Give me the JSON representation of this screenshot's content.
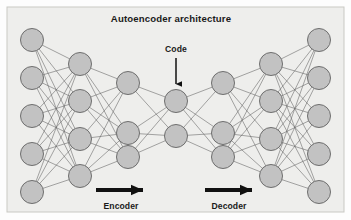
{
  "figure": {
    "title": "Autoencoder architecture",
    "panel": {
      "background_color": "#eeeeec",
      "border_color": "#c9c9c4",
      "x": 7,
      "y": 7,
      "width": 337,
      "height": 205
    },
    "node_style": {
      "fill_color": "#c2c2c2",
      "stroke_color": "#6e6e6e",
      "radius": 11.5
    },
    "edge_style": {
      "stroke_color": "#5f5f5f",
      "stroke_width": 0.55
    },
    "annotations": {
      "code_label": "Code",
      "encoder_label": "Encoder",
      "decoder_label": "Decoder",
      "arrow_color": "#111111"
    },
    "layers": [
      {
        "name": "input-layer",
        "node_count": 5,
        "cx": 32,
        "cys": [
          40,
          78,
          116,
          154,
          192
        ]
      },
      {
        "name": "encoder-hidden-1",
        "node_count": 4,
        "cx": 80,
        "cys": [
          64,
          101,
          139,
          176
        ]
      },
      {
        "name": "encoder-hidden-2",
        "node_count": 3,
        "cx": 128,
        "cys": [
          83,
          133,
          157
        ]
      },
      {
        "name": "code-layer",
        "node_count": 2,
        "cx": 176,
        "cys": [
          101,
          136
        ]
      },
      {
        "name": "decoder-hidden-1",
        "node_count": 3,
        "cx": 223,
        "cys": [
          83,
          133,
          157
        ]
      },
      {
        "name": "decoder-hidden-2",
        "node_count": 4,
        "cx": 271,
        "cys": [
          64,
          101,
          139,
          176
        ]
      },
      {
        "name": "output-layer",
        "node_count": 5,
        "cx": 319,
        "cys": [
          40,
          78,
          116,
          154,
          192
        ]
      }
    ],
    "code_arrow": {
      "x": 176,
      "y_start": 58,
      "y_end": 84
    },
    "encoder_arrow": {
      "x_start": 96,
      "x_end": 143,
      "y": 190
    },
    "decoder_arrow": {
      "x_start": 205,
      "x_end": 252,
      "y": 190
    },
    "title_pos": {
      "x": 171,
      "y": 22
    },
    "code_label_pos": {
      "x": 176,
      "y": 52
    },
    "encoder_label_pos": {
      "x": 121,
      "y": 209
    },
    "decoder_label_pos": {
      "x": 229,
      "y": 209
    }
  }
}
